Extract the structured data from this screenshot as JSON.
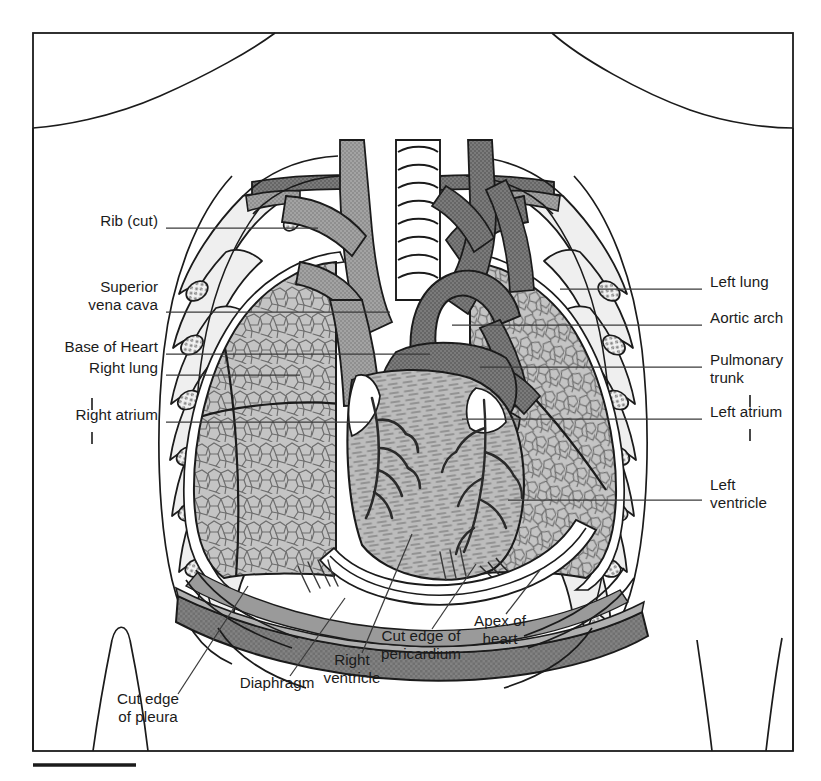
{
  "figure": {
    "type": "anatomical-illustration",
    "frame": {
      "x": 33,
      "y": 33,
      "width": 760,
      "height": 718
    },
    "scale_rule": {
      "x1": 33,
      "x2": 136,
      "y": 765
    }
  },
  "palette": {
    "ink": "#1b1b1b",
    "leader": "#3a3a3a",
    "lung_fill": "#b9b9b9",
    "lung_light": "#d2d2d2",
    "vessel_light": "#9a9a9a",
    "vessel_dark": "#6e6e6e",
    "heart_fill": "#b2b2b2",
    "diaphragm": "#777777",
    "diaphragm_light": "#a6a6a6",
    "bone": "#efefef",
    "white": "#ffffff"
  },
  "labels": {
    "left": [
      {
        "key": "rib-cut",
        "lines": [
          "Rib (cut)"
        ],
        "x": 158,
        "y": 222,
        "anchor": "right",
        "leader": [
          [
            166,
            228
          ],
          [
            318,
            228
          ]
        ]
      },
      {
        "key": "superior-vena-cava",
        "lines": [
          "Superior",
          "vena cava"
        ],
        "x": 158,
        "y": 288,
        "anchor": "right",
        "leader": [
          [
            166,
            312
          ],
          [
            390,
            312
          ]
        ]
      },
      {
        "key": "base-of-heart",
        "lines": [
          "Base of Heart"
        ],
        "x": 158,
        "y": 348,
        "anchor": "right",
        "leader": [
          [
            166,
            354
          ],
          [
            430,
            354
          ]
        ]
      },
      {
        "key": "right-lung",
        "lines": [
          "Right lung"
        ],
        "x": 158,
        "y": 369,
        "anchor": "right",
        "leader": [
          [
            166,
            375
          ],
          [
            300,
            375
          ]
        ]
      },
      {
        "key": "right-atrium",
        "lines": [
          "Right atrium"
        ],
        "x": 158,
        "y": 416,
        "anchor": "right",
        "leader": [
          [
            166,
            422
          ],
          [
            368,
            422
          ]
        ],
        "ticks": [
          [
            92,
            398,
            92,
            410
          ],
          [
            92,
            432,
            92,
            444
          ]
        ]
      }
    ],
    "right": [
      {
        "key": "left-lung",
        "lines": [
          "Left lung"
        ],
        "x": 710,
        "y": 283,
        "anchor": "left",
        "leader": [
          [
            702,
            289
          ],
          [
            560,
            289
          ]
        ]
      },
      {
        "key": "aortic-arch",
        "lines": [
          "Aortic arch"
        ],
        "x": 710,
        "y": 319,
        "anchor": "left",
        "leader": [
          [
            702,
            325
          ],
          [
            452,
            325
          ]
        ]
      },
      {
        "key": "pulmonary-trunk",
        "lines": [
          "Pulmonary",
          "trunk"
        ],
        "x": 710,
        "y": 361,
        "anchor": "left",
        "leader": [
          [
            702,
            367
          ],
          [
            480,
            367
          ]
        ]
      },
      {
        "key": "left-atrium",
        "lines": [
          "Left atrium"
        ],
        "x": 710,
        "y": 413,
        "anchor": "left",
        "leader": [
          [
            702,
            419
          ],
          [
            462,
            419
          ]
        ],
        "ticks": [
          [
            750,
            395,
            750,
            407
          ],
          [
            750,
            429,
            750,
            441
          ]
        ]
      },
      {
        "key": "left-ventricle",
        "lines": [
          "Left",
          "ventricle"
        ],
        "x": 710,
        "y": 486,
        "anchor": "left",
        "leader": [
          [
            702,
            500
          ],
          [
            508,
            500
          ]
        ]
      }
    ],
    "bottom": [
      {
        "key": "cut-edge-of-pleura",
        "lines": [
          "Cut edge",
          "of pleura"
        ],
        "x": 148,
        "y": 700,
        "anchor": "center",
        "leader": [
          [
            178,
            694
          ],
          [
            248,
            586
          ]
        ]
      },
      {
        "key": "diaphragm",
        "lines": [
          "Diaphragm"
        ],
        "x": 277,
        "y": 684,
        "anchor": "center",
        "leader": [
          [
            290,
            676
          ],
          [
            345,
            598
          ]
        ]
      },
      {
        "key": "right-ventricle",
        "lines": [
          "Right",
          "ventricle"
        ],
        "x": 352,
        "y": 661,
        "anchor": "center",
        "leader": [
          [
            362,
            653
          ],
          [
            412,
            534
          ]
        ]
      },
      {
        "key": "cut-edge-of-pericardium",
        "lines": [
          "Cut edge of",
          "pericardium"
        ],
        "x": 421,
        "y": 637,
        "anchor": "center",
        "leader": [
          [
            432,
            629
          ],
          [
            476,
            564
          ]
        ]
      },
      {
        "key": "apex-of-heart",
        "lines": [
          "Apex of",
          "heart"
        ],
        "x": 500,
        "y": 622,
        "anchor": "center",
        "leader": [
          [
            506,
            614
          ],
          [
            540,
            570
          ]
        ]
      }
    ]
  }
}
